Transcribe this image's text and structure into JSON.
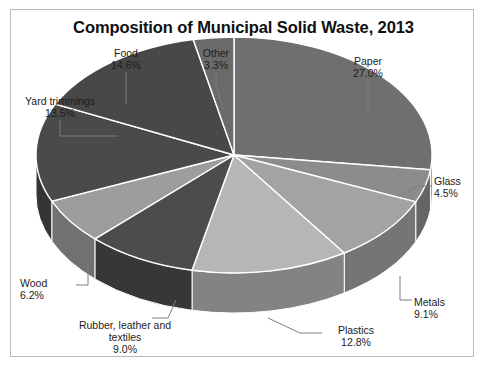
{
  "chart_data": {
    "type": "pie",
    "title": "Composition of Municipal Solid Waste, 2013",
    "xlabel": "",
    "ylabel": "",
    "units": "percent",
    "legend": "none",
    "grid": false,
    "three_d": true,
    "start_angle_deg": 0,
    "direction": "clockwise",
    "categories": [
      "Paper",
      "Glass",
      "Metals",
      "Plastics",
      "Rubber, leather and textiles",
      "Wood",
      "Yard trimmings",
      "Food",
      "Other"
    ],
    "values": [
      27.0,
      4.5,
      9.1,
      12.8,
      9.0,
      6.2,
      13.5,
      14.6,
      3.3
    ],
    "labels": [
      "27.0%",
      "4.5%",
      "9.1%",
      "12.8%",
      "9.0%",
      "6.2%",
      "13.5%",
      "14.6%",
      "3.3%"
    ],
    "colors": [
      "#6f6f6f",
      "#8c8c8c",
      "#a3a3a3",
      "#b6b6b6",
      "#4c4c4c",
      "#9d9d9d",
      "#4a4a4a",
      "#484848",
      "#6a6a6a"
    ],
    "slices": [
      {
        "name": "Paper",
        "value": 27.0,
        "label": "27.0%",
        "color": "#6f6f6f"
      },
      {
        "name": "Glass",
        "value": 4.5,
        "label": "4.5%",
        "color": "#8c8c8c"
      },
      {
        "name": "Metals",
        "value": 9.1,
        "label": "9.1%",
        "color": "#a3a3a3"
      },
      {
        "name": "Plastics",
        "value": 12.8,
        "label": "12.8%",
        "color": "#b6b6b6"
      },
      {
        "name": "Rubber, leather and textiles",
        "value": 9.0,
        "label": "9.0%",
        "color": "#4c4c4c"
      },
      {
        "name": "Wood",
        "value": 6.2,
        "label": "6.2%",
        "color": "#9d9d9d"
      },
      {
        "name": "Yard trimmings",
        "value": 13.5,
        "label": "13.5%",
        "color": "#4a4a4a"
      },
      {
        "name": "Food",
        "value": 14.6,
        "label": "14.6%",
        "color": "#484848"
      },
      {
        "name": "Other",
        "value": 3.3,
        "label": "3.3%",
        "color": "#6a6a6a"
      }
    ]
  },
  "labels": {
    "food": {
      "name": "Food",
      "pct": "14.6%"
    },
    "other": {
      "name": "Other",
      "pct": "3.3%"
    },
    "paper": {
      "name": "Paper",
      "pct": "27.0%"
    },
    "yard": {
      "name": "Yard trimmings",
      "pct": "13.5%"
    },
    "glass": {
      "name": "Glass",
      "pct": "4.5%"
    },
    "metals": {
      "name": "Metals",
      "pct": "9.1%"
    },
    "plastics": {
      "name": "Plastics",
      "pct": "12.8%"
    },
    "rubber": {
      "name": "Rubber, leather and",
      "name2": "textiles",
      "pct": "9.0%"
    },
    "wood": {
      "name": "Wood",
      "pct": "6.2%"
    }
  },
  "style": {
    "background": "#ffffff",
    "border_color": "#b9b9b9",
    "text_color": "#1c1c1c",
    "slice_edge": "#ffffff"
  }
}
